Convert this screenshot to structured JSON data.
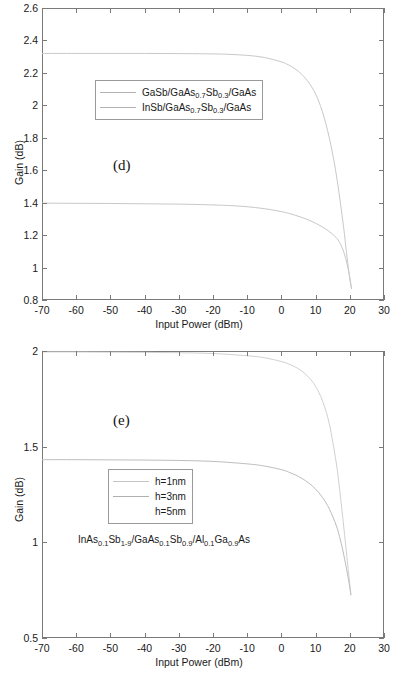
{
  "chart_data": [
    {
      "type": "line",
      "panel": "(d)",
      "title": "",
      "xlabel": "Input Power (dBm)",
      "ylabel": "Gain (dB)",
      "xlim": [
        -70,
        30
      ],
      "ylim": [
        0.8,
        2.6
      ],
      "xticks": [
        -70,
        -60,
        -50,
        -40,
        -30,
        -20,
        -10,
        0,
        10,
        20,
        30
      ],
      "xticklabels": [
        "-70",
        "-60",
        "-50",
        "-40",
        "-30",
        "-20",
        "-10",
        "0",
        "10",
        "20",
        "30"
      ],
      "yticks": [
        0.8,
        1,
        1.2,
        1.4,
        1.6,
        1.8,
        2,
        2.2,
        2.4,
        2.6
      ],
      "yticklabels": [
        "0.8",
        "1",
        "1.2",
        "1.4",
        "1.6",
        "1.8",
        "2",
        "2.2",
        "2.4",
        "2.6"
      ],
      "grid": false,
      "legend_position": "upper-center-left",
      "legend_entries": [
        {
          "label_parts": [
            "GaSb/GaAs",
            "0.7",
            "Sb",
            "0.3",
            "/GaAs"
          ],
          "color": "#b4b4b4"
        },
        {
          "label_parts": [
            "InSb/GaAs",
            "0.7",
            "Sb",
            "0.3",
            "/GaAs"
          ],
          "color": "#b4b4b4"
        }
      ],
      "series": [
        {
          "name": "GaSb/GaAs0.7Sb0.3/GaAs",
          "color": "#c8c8c8",
          "x": [
            -70,
            -60,
            -50,
            -40,
            -30,
            -20,
            -15,
            -10,
            -5,
            0,
            2,
            4,
            6,
            8,
            10,
            12,
            14,
            16,
            18,
            19,
            20,
            20.5
          ],
          "y": [
            2.32,
            2.32,
            2.32,
            2.32,
            2.319,
            2.317,
            2.314,
            2.308,
            2.295,
            2.268,
            2.25,
            2.225,
            2.19,
            2.14,
            2.07,
            1.96,
            1.8,
            1.58,
            1.28,
            1.1,
            0.93,
            0.87
          ]
        },
        {
          "name": "InSb/GaAs0.7Sb0.3/GaAs",
          "color": "#c8c8c8",
          "x": [
            -70,
            -60,
            -50,
            -40,
            -30,
            -20,
            -15,
            -10,
            -5,
            0,
            2,
            4,
            6,
            8,
            10,
            12,
            14,
            16,
            17,
            18,
            19,
            20,
            20.5
          ],
          "y": [
            1.397,
            1.396,
            1.395,
            1.393,
            1.391,
            1.386,
            1.382,
            1.375,
            1.363,
            1.345,
            1.335,
            1.323,
            1.309,
            1.293,
            1.273,
            1.25,
            1.222,
            1.185,
            1.155,
            1.11,
            1.04,
            0.94,
            0.87
          ]
        }
      ]
    },
    {
      "type": "line",
      "panel": "(e)",
      "title": "",
      "xlabel": "Input Power (dBm)",
      "ylabel": "Gain (dB)",
      "xlim": [
        -70,
        30
      ],
      "ylim": [
        0.5,
        2.0
      ],
      "xticks": [
        -70,
        -60,
        -50,
        -40,
        -30,
        -20,
        -10,
        0,
        10,
        20,
        30
      ],
      "xticklabels": [
        "-70",
        "-60",
        "-50",
        "-40",
        "-30",
        "-20",
        "-10",
        "0",
        "10",
        "20",
        "30"
      ],
      "yticks": [
        0.5,
        1,
        1.5,
        2
      ],
      "yticklabels": [
        "0.5",
        "1",
        "1.5",
        "2"
      ],
      "grid": false,
      "legend_position": "center-left",
      "legend_entries": [
        {
          "label": "h=1nm",
          "color": "#c4c4c4"
        },
        {
          "label": "h=3nm",
          "color": "#b0b0b0"
        },
        {
          "label": "h=5nm",
          "color": "#ffffff"
        }
      ],
      "annotation_parts": [
        "InAs",
        "0.1",
        "Sb",
        "1-9",
        "/GaAs",
        "0.1",
        "Sb",
        "0.9",
        "/Al",
        "0.1",
        "Ga",
        "0.9",
        "As"
      ],
      "series": [
        {
          "name": "h=1nm",
          "color": "#d0d0d0",
          "x": [
            -70,
            -60,
            -50,
            -40,
            -30,
            -20,
            -10,
            -5,
            0,
            2,
            4,
            6,
            8,
            10,
            12,
            14,
            16,
            17,
            18,
            19,
            20,
            20.3
          ],
          "y": [
            1.995,
            1.995,
            1.994,
            1.993,
            1.991,
            1.987,
            1.975,
            1.965,
            1.945,
            1.933,
            1.917,
            1.895,
            1.862,
            1.815,
            1.74,
            1.62,
            1.42,
            1.28,
            1.12,
            0.95,
            0.78,
            0.73
          ]
        },
        {
          "name": "h=3nm",
          "color": "#bdbdbd",
          "x": [
            -70,
            -60,
            -50,
            -40,
            -30,
            -20,
            -10,
            -5,
            0,
            2,
            4,
            6,
            8,
            10,
            12,
            14,
            16,
            17,
            18,
            19,
            20,
            20.3
          ],
          "y": [
            1.432,
            1.432,
            1.431,
            1.43,
            1.428,
            1.423,
            1.41,
            1.399,
            1.38,
            1.368,
            1.353,
            1.334,
            1.31,
            1.278,
            1.235,
            1.175,
            1.09,
            1.03,
            0.955,
            0.865,
            0.765,
            0.725
          ]
        }
      ]
    }
  ]
}
